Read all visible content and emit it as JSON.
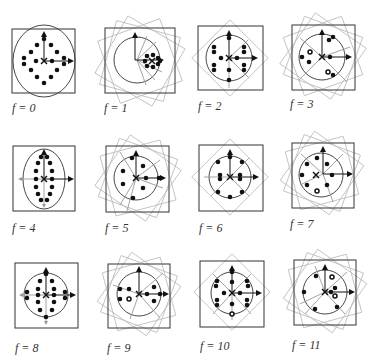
{
  "figure": {
    "panels": [
      {
        "f": 0,
        "label": "f = 0",
        "rot_squares": [],
        "cx": 44,
        "cy": 61,
        "box": [
          12,
          29,
          63,
          64
        ],
        "rx": 31,
        "ry": 36,
        "dots": [
          [
            0,
            -22
          ],
          [
            -13,
            -15
          ],
          [
            13,
            -15
          ],
          [
            -13,
            -1
          ],
          [
            0,
            0
          ],
          [
            13,
            -1
          ],
          [
            -13,
            12
          ],
          [
            13,
            12
          ],
          [
            -4,
            -26
          ],
          [
            -19,
            4
          ],
          [
            25,
            4
          ],
          [
            -25,
            -3
          ],
          [
            25,
            -3
          ],
          [
            0,
            -8
          ],
          [
            0,
            8
          ],
          [
            -9,
            24
          ],
          [
            9,
            24
          ],
          [
            0,
            27
          ],
          [
            -6,
            10
          ],
          [
            6,
            10
          ]
        ],
        "gray_arrows": []
      },
      {
        "f": 1,
        "label": "f = 1",
        "rot_squares": [
          15,
          30,
          -20
        ],
        "cx": 137,
        "cy": 60,
        "box": [
          105,
          28,
          70,
          65
        ],
        "rx": 23,
        "ry": 25,
        "cluster": [
          150,
          61
        ],
        "gray_arrows": [
          [
            -15,
            -25
          ],
          [
            -30,
            -20
          ],
          [
            -30,
            0
          ],
          [
            -30,
            20
          ],
          [
            -15,
            25
          ]
        ]
      },
      {
        "f": 2,
        "label": "f = 2",
        "rot_squares": [
          45
        ],
        "cx": 229,
        "cy": 58,
        "box": [
          198,
          26,
          65,
          64
        ],
        "rx": 22,
        "ry": 24,
        "gray_arrows": [
          [
            30,
            -30
          ],
          [
            30,
            30
          ],
          [
            0,
            32
          ],
          [
            -25,
            25
          ]
        ]
      },
      {
        "f": 3,
        "label": "f = 3",
        "rot_squares": [
          20,
          -20,
          35
        ],
        "cx": 322,
        "cy": 57,
        "box": [
          292,
          25,
          63,
          65
        ],
        "rx": 22,
        "ry": 24,
        "gray_arrows": [
          [
            30,
            -15
          ],
          [
            25,
            25
          ],
          [
            -25,
            25
          ],
          [
            -25,
            -20
          ]
        ]
      },
      {
        "f": 4,
        "label": "f = 4",
        "rot_squares": [],
        "cx": 44,
        "cy": 179,
        "box": [
          13,
          146,
          62,
          65
        ],
        "rx": 21,
        "ry": 30,
        "gray_arrows": [
          [
            -25,
            0
          ],
          [
            0,
            33
          ]
        ]
      },
      {
        "f": 5,
        "label": "f = 5",
        "rot_squares": [
          20,
          -15,
          35
        ],
        "cx": 136,
        "cy": 178,
        "box": [
          106,
          146,
          63,
          66
        ],
        "rx": 21,
        "ry": 24,
        "gray_arrows": [
          [
            -20,
            -28
          ],
          [
            25,
            -20
          ],
          [
            27,
            10
          ],
          [
            -20,
            28
          ],
          [
            -10,
            33
          ]
        ]
      },
      {
        "f": 6,
        "label": "f = 6",
        "rot_squares": [
          45
        ],
        "cx": 230,
        "cy": 177,
        "box": [
          199,
          145,
          64,
          66
        ],
        "rx": 21,
        "ry": 23,
        "gray_arrows": [
          [
            -28,
            0
          ],
          [
            -20,
            22
          ],
          [
            20,
            22
          ],
          [
            20,
            -22
          ],
          [
            -20,
            -22
          ]
        ]
      },
      {
        "f": 7,
        "label": "f = 7",
        "rot_squares": [
          20,
          -15,
          35
        ],
        "cx": 320,
        "cy": 173,
        "box": [
          292,
          143,
          62,
          65
        ],
        "rx": 22,
        "ry": 23,
        "gray_arrows": [
          [
            -22,
            -20
          ],
          [
            20,
            -20
          ],
          [
            -22,
            11
          ],
          [
            10,
            26
          ],
          [
            -15,
            25
          ]
        ]
      },
      {
        "f": 8,
        "label": "f = 8",
        "rot_squares": [],
        "cx": 46,
        "cy": 295,
        "box": [
          15,
          263,
          63,
          65
        ],
        "rx": 21,
        "ry": 24,
        "gray_arrows": [
          [
            -27,
            0
          ],
          [
            0,
            27
          ],
          [
            27,
            0
          ]
        ]
      },
      {
        "f": 9,
        "label": "f = 9",
        "rot_squares": [
          20,
          -15,
          35
        ],
        "cx": 139,
        "cy": 294,
        "box": [
          108,
          264,
          62,
          64
        ],
        "rx": 22,
        "ry": 24,
        "gray_arrows": [
          [
            -28,
            -8
          ],
          [
            25,
            -20
          ],
          [
            -10,
            27
          ],
          [
            20,
            25
          ]
        ]
      },
      {
        "f": 10,
        "label": "f = 10",
        "rot_squares": [
          45
        ],
        "cx": 232,
        "cy": 292,
        "box": [
          200,
          261,
          64,
          66
        ],
        "rx": 21,
        "ry": 23,
        "gray_arrows": [
          [
            -20,
            -20
          ],
          [
            -20,
            22
          ],
          [
            20,
            22
          ],
          [
            20,
            -20
          ],
          [
            0,
            27
          ]
        ]
      },
      {
        "f": 11,
        "label": "f = 11",
        "rot_squares": [
          20,
          -15,
          35
        ],
        "cx": 325,
        "cy": 292,
        "box": [
          294,
          260,
          62,
          65
        ],
        "rx": 22,
        "ry": 23,
        "gray_arrows": [
          [
            -10,
            -27
          ],
          [
            -25,
            12
          ],
          [
            20,
            22
          ],
          [
            -20,
            22
          ],
          [
            22,
            -20
          ]
        ]
      }
    ]
  }
}
